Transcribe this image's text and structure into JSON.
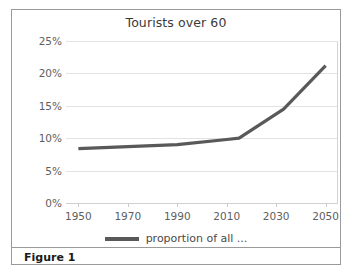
{
  "figure": {
    "caption": "Figure 1",
    "legend_marker": "line-swatch"
  },
  "chart_data": {
    "type": "line",
    "title": "Tourists over 60",
    "xlabel": "",
    "ylabel": "",
    "xlim": [
      1945,
      2055
    ],
    "ylim": [
      0,
      25
    ],
    "grid": true,
    "legend_position": "bottom",
    "xticks": [
      1950,
      1970,
      1990,
      2010,
      2030,
      2050
    ],
    "xtick_labels": [
      "1950",
      "1970",
      "1990",
      "2010",
      "2030",
      "2050"
    ],
    "yticks": [
      0,
      5,
      10,
      15,
      20,
      25
    ],
    "ytick_labels": [
      "0%",
      "5%",
      "10%",
      "15%",
      "20%",
      "25%"
    ],
    "series": [
      {
        "name": "proportion of all ...",
        "color": "#595959",
        "x": [
          1950,
          1970,
          1990,
          2010,
          2015,
          2033,
          2050
        ],
        "values": [
          8.4,
          8.7,
          9.0,
          9.8,
          10.0,
          14.5,
          21.2
        ]
      }
    ]
  }
}
